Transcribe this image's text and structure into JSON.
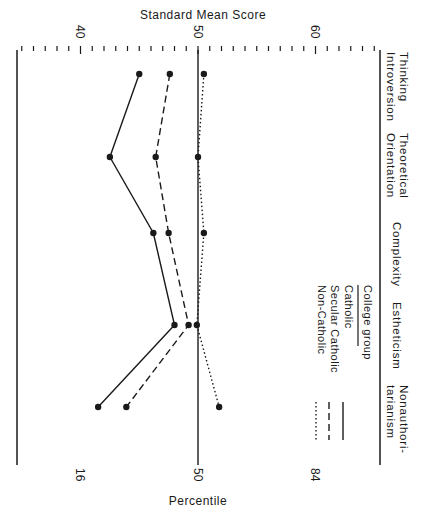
{
  "chart_data": {
    "type": "line",
    "orientation": "rotated-90",
    "title": "",
    "top_axis_label": "Standard Mean Score",
    "bottom_axis_label": "Percentile",
    "score_ticks": [
      40,
      50,
      60
    ],
    "percentile_ticks": [
      {
        "label": "16",
        "score": 40
      },
      {
        "label": "50",
        "score": 50
      },
      {
        "label": "84",
        "score": 60
      }
    ],
    "score_range": [
      35,
      66
    ],
    "categories": [
      "Thinking Introversion",
      "Theoretical Orientation",
      "Complexity",
      "Estheticism",
      "Nonauthoritarianism"
    ],
    "category_lines": [
      [
        "Thinking",
        "Introversion"
      ],
      [
        "Theoretical",
        "Orientation"
      ],
      [
        "Complexity"
      ],
      [
        "Estheticism"
      ],
      [
        "Nonauthori-",
        "tarianism"
      ]
    ],
    "legend": {
      "title": "College group",
      "entries": [
        {
          "name": "Catholic",
          "style": "solid"
        },
        {
          "name": "Secular Catholic",
          "style": "dashed"
        },
        {
          "name": "Non-Catholic",
          "style": "dotted"
        }
      ]
    },
    "series": [
      {
        "name": "Catholic",
        "style": "solid",
        "values": [
          45.0,
          42.5,
          46.2,
          48.0,
          41.5
        ]
      },
      {
        "name": "Secular Catholic",
        "style": "dashed",
        "values": [
          47.6,
          46.4,
          47.5,
          49.2,
          43.9
        ]
      },
      {
        "name": "Non-Catholic",
        "style": "dotted",
        "values": [
          50.5,
          50.0,
          50.5,
          49.9,
          51.8
        ]
      }
    ],
    "reference_line": 50,
    "grid": false
  },
  "labels": {
    "top_axis": "Standard Mean Score",
    "bottom_axis": "Percentile",
    "score_40": "40",
    "score_50": "50",
    "score_60": "60",
    "pct_16": "16",
    "pct_50": "50",
    "pct_84": "84",
    "cat_1a": "Thinking",
    "cat_1b": "Introversion",
    "cat_2a": "Theoretical",
    "cat_2b": "Orientation",
    "cat_3": "Complexity",
    "cat_4": "Estheticism",
    "cat_5a": "Nonauthori-",
    "cat_5b": "tarianism",
    "legend_title": "College group",
    "legend_1": "Catholic",
    "legend_2": "Secular Catholic",
    "legend_3": "Non-Catholic"
  }
}
